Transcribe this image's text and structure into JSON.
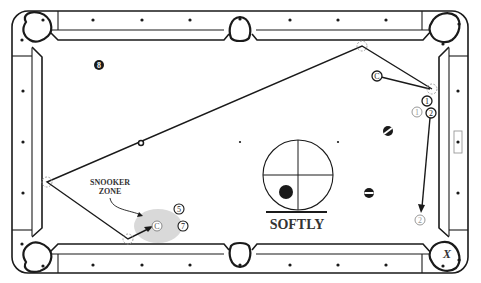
{
  "diagram": {
    "labels": {
      "snooker_zone_line1": "SNOOKER",
      "snooker_zone_line2": "ZONE",
      "softly": "SOFTLY",
      "pocket_x": "X"
    },
    "balls": [
      {
        "id": "8",
        "label": "8",
        "style": "solid-black",
        "x": 99,
        "y": 65
      },
      {
        "id": "cue_start",
        "label": "C",
        "style": "outline",
        "x": 377,
        "y": 76
      },
      {
        "id": "1",
        "label": "1",
        "style": "outline",
        "x": 427,
        "y": 101
      },
      {
        "id": "1_ghost",
        "label": "1",
        "style": "ghost",
        "x": 417,
        "y": 110
      },
      {
        "id": "2",
        "label": "2",
        "style": "outline",
        "x": 431,
        "y": 113
      },
      {
        "id": "2_ghost",
        "label": "2",
        "style": "ghost",
        "x": 420,
        "y": 220
      },
      {
        "id": "5",
        "label": "5",
        "style": "outline",
        "x": 179,
        "y": 209
      },
      {
        "id": "7",
        "label": "7",
        "style": "outline",
        "x": 183,
        "y": 226
      },
      {
        "id": "cue_end",
        "label": "C",
        "style": "ghost-outline",
        "x": 157,
        "y": 226
      },
      {
        "id": "stripe_a",
        "label": "",
        "style": "stripe",
        "x": 388,
        "y": 131
      },
      {
        "id": "stripe_b",
        "label": "",
        "style": "stripe",
        "x": 369,
        "y": 193
      },
      {
        "id": "small_ring",
        "label": "",
        "style": "ring",
        "x": 141,
        "y": 143
      }
    ],
    "cue_tip_diagram": {
      "cx": 298,
      "cy": 175,
      "r": 35,
      "hit_x": 286,
      "hit_y": 192
    },
    "colors": {
      "line": "#1a1a1a",
      "ghost": "#999999",
      "zone": "#d9d9d9",
      "background": "#ffffff"
    }
  }
}
